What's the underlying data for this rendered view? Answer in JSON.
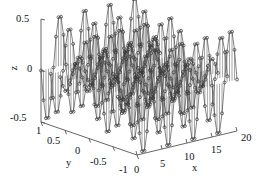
{
  "figure": {
    "title": "",
    "background": "#ffffff",
    "foreground": "#1a1a1a",
    "marker_color": "#3a3a3a",
    "stem_color": "#8a8a8a",
    "axis_color": "#555555"
  },
  "axes": {
    "x": {
      "label": "x",
      "ticks": [
        "0",
        "5",
        "10",
        "15",
        "20"
      ],
      "tick_values": [
        0,
        5,
        10,
        15,
        20
      ],
      "range": [
        0,
        20
      ]
    },
    "y": {
      "label": "y",
      "ticks": [
        "1",
        "0.5",
        "0",
        "-0.5",
        "-1"
      ],
      "tick_values": [
        1,
        0.5,
        0,
        -0.5,
        -1
      ],
      "range": [
        -1,
        1
      ]
    },
    "z": {
      "label": "z",
      "ticks": [
        "0.5",
        "0",
        "-0.5"
      ],
      "tick_values": [
        0.5,
        0,
        -0.5
      ],
      "range": [
        -0.5,
        0.5
      ]
    }
  },
  "chart_data": {
    "type": "scatter",
    "plot_style": "stem3",
    "title": "",
    "xlabel": "x",
    "ylabel": "y",
    "zlabel": "z",
    "xlim": [
      0,
      20
    ],
    "ylim": [
      -1,
      1
    ],
    "zlim": [
      -0.5,
      0.5
    ],
    "xticks": [
      0,
      5,
      10,
      15,
      20
    ],
    "yticks": [
      -1,
      -0.5,
      0,
      0.5,
      1
    ],
    "zticks": [
      -0.5,
      0,
      0.5
    ],
    "grid": false,
    "legend": null,
    "marker": "o",
    "x_samples": [
      0,
      0.5,
      1,
      1.5,
      2,
      2.5,
      3,
      3.5,
      4,
      4.5,
      5,
      5.5,
      6,
      6.5,
      7,
      7.5,
      8,
      8.5,
      9,
      9.5,
      10,
      10.5,
      11,
      11.5,
      12,
      12.5,
      13,
      13.5,
      14,
      14.5,
      15,
      15.5,
      16,
      16.5,
      17,
      17.5,
      18,
      18.5,
      19,
      19.5,
      20
    ],
    "y_samples": [
      -1,
      -0.8,
      -0.6,
      -0.4,
      -0.2,
      0,
      0.2,
      0.4,
      0.6,
      0.8,
      1
    ],
    "z_formula": "0.5*sin(pi*x/2.5)*cos(pi*y)",
    "z_peak": 0.5,
    "z_trough": -0.5,
    "peak_count_along_x": 4,
    "n_points": 451,
    "azimuth_deg": -37.5,
    "elevation_deg": 30
  }
}
